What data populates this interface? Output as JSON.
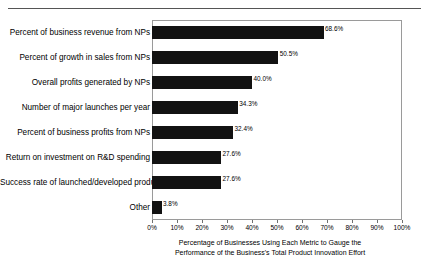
{
  "chart_data": {
    "type": "bar",
    "orientation": "horizontal",
    "title": "",
    "xlabel": "Percentage of Businesses Using Each Metric to Gauge the Performance of the Business's Total Product Innovation Effort",
    "xlabel_lines": [
      "Percentage of Businesses Using Each Metric to Gauge the",
      "Performance of the Business's Total Product Innovation Effort"
    ],
    "ylabel": "",
    "xlim": [
      0,
      100
    ],
    "grid": false,
    "legend": false,
    "xticks": [
      0,
      10,
      20,
      30,
      40,
      50,
      60,
      70,
      80,
      90,
      100
    ],
    "xtick_labels": [
      "0%",
      "10%",
      "20%",
      "30%",
      "40%",
      "50%",
      "60%",
      "70%",
      "80%",
      "90%",
      "100%"
    ],
    "categories": [
      "Percent of business revenue from NPs",
      "Percent of growth in sales from NPs",
      "Overall profits generated by NPs",
      "Number of major launches per year",
      "Percent of business profits from NPs",
      "Return on investment on R&D spending",
      "Success rate of launched/developed products",
      "Other"
    ],
    "values": [
      68.6,
      50.5,
      40.0,
      34.3,
      32.4,
      27.6,
      27.6,
      3.8
    ],
    "value_labels": [
      "68.6%",
      "50.5%",
      "40.0%",
      "34.3%",
      "32.4%",
      "27.6%",
      "27.6%",
      "3.8%"
    ],
    "bar_color": "#121212",
    "frame_color": "#9a9a9a"
  }
}
